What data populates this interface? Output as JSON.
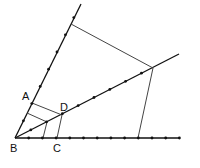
{
  "diagram": {
    "points": {
      "A": "A",
      "B": "B",
      "C": "C",
      "D": "D"
    },
    "labels": [
      {
        "id": "A",
        "text": "A"
      },
      {
        "id": "B",
        "text": "B"
      },
      {
        "id": "C",
        "text": "C"
      },
      {
        "id": "D",
        "text": "D"
      }
    ],
    "rays": [
      "upper-ray",
      "middle-ray",
      "lower-ray"
    ],
    "tick_counts": {
      "upper_ray": 8,
      "middle_ray": 8,
      "lower_ray": 12
    },
    "colors": {
      "ray": "#111111",
      "segment": "#444444",
      "label": "#111111"
    }
  }
}
